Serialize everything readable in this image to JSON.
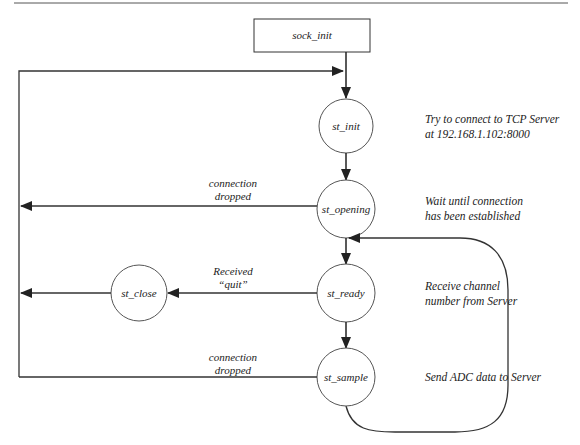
{
  "diagram": {
    "type": "state-machine",
    "colors": {
      "line": "#333333",
      "text": "#222222",
      "background": "#ffffff"
    },
    "start_box": {
      "label": "sock_init"
    },
    "states": {
      "st_init": {
        "label": "st_init"
      },
      "st_opening": {
        "label": "st_opening"
      },
      "st_ready": {
        "label": "st_ready"
      },
      "st_sample": {
        "label": "st_sample"
      },
      "st_close": {
        "label": "st_close"
      }
    },
    "transitions": {
      "opening_dropped": {
        "line1": "connection",
        "line2": "dropped"
      },
      "ready_quit": {
        "line1": "Received",
        "line2": "“quit”"
      },
      "sample_dropped": {
        "line1": "connection",
        "line2": "dropped"
      }
    },
    "notes": {
      "st_init": {
        "line1": "Try to connect to TCP Server",
        "line2": "at 192.168.1.102:8000"
      },
      "st_opening": {
        "line1": "Wait until connection",
        "line2": "has been established"
      },
      "st_ready": {
        "line1": "Receive channel",
        "line2": "number from Server"
      },
      "st_sample": {
        "line1": "Send ADC data to Server"
      }
    }
  }
}
